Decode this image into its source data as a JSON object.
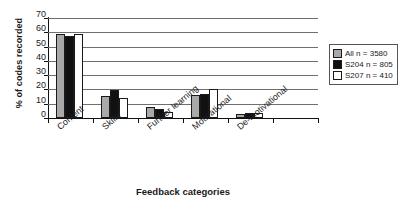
{
  "chart_data": {
    "type": "bar",
    "title": "",
    "xlabel": "Feedback categories",
    "ylabel": "% of codes recorded",
    "categories": [
      "Content",
      "Skills",
      "Further learning",
      "Motivational",
      "De-motivational"
    ],
    "series": [
      {
        "name": "All n = 3580",
        "color": "#a9a9a9",
        "values": [
          59,
          15.5,
          7.5,
          16,
          2.5
        ]
      },
      {
        "name": "S204 n = 805",
        "color": "#111111",
        "values": [
          57.5,
          19.5,
          6,
          16.5,
          3.5
        ]
      },
      {
        "name": "S207 n = 410",
        "color": "#ffffff",
        "values": [
          59,
          14,
          4,
          20,
          3.5
        ]
      }
    ],
    "ylim": [
      0,
      70
    ],
    "yticks": [
      0,
      10,
      20,
      30,
      40,
      50,
      60,
      70
    ],
    "ytick_labels": [
      "0",
      "10",
      "20",
      "30",
      "40",
      "50",
      "60",
      "70"
    ],
    "grid": true,
    "legend_position": "right"
  },
  "legend": {
    "items": [
      {
        "label": "All n = 3580",
        "swatch": "gray-swatch"
      },
      {
        "label": "S204 n = 805",
        "swatch": "black-swatch"
      },
      {
        "label": "S207 n = 410",
        "swatch": "white-swatch"
      }
    ]
  }
}
